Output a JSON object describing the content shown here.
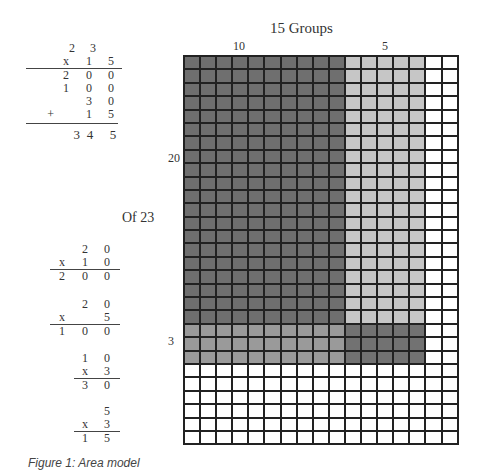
{
  "title": "15 Groups",
  "column_labels": {
    "tens": "10",
    "ones": "5"
  },
  "row_labels": {
    "tens": "20",
    "ones": "3"
  },
  "side_label": "Of 23",
  "main_problem": {
    "rows": [
      [
        "",
        "",
        "2",
        "3"
      ],
      [
        "",
        "x",
        "1",
        "5"
      ],
      [
        "",
        "2",
        "0",
        "0"
      ],
      [
        "",
        "1",
        "0",
        "0"
      ],
      [
        "",
        "",
        "3",
        "0"
      ],
      [
        "+",
        "",
        "1",
        "5"
      ],
      [
        "",
        "3",
        "4",
        "5"
      ]
    ]
  },
  "partial_products": [
    {
      "rows": [
        [
          "",
          "2",
          "0"
        ],
        [
          "x",
          "1",
          "0"
        ],
        [
          "2",
          "0",
          "0"
        ]
      ]
    },
    {
      "rows": [
        [
          "",
          "2",
          "0"
        ],
        [
          "x",
          "",
          "5"
        ],
        [
          "1",
          "0",
          "0"
        ]
      ]
    },
    {
      "rows": [
        [
          "1",
          "0"
        ],
        [
          "x",
          "3"
        ],
        [
          "3",
          "0"
        ]
      ]
    },
    {
      "rows": [
        [
          "",
          "5"
        ],
        [
          "x",
          "3"
        ],
        [
          "1",
          "5"
        ]
      ]
    }
  ],
  "grid": {
    "columns": 17,
    "rows": 29,
    "tens_columns": 10,
    "ones_columns": 5,
    "tens_rows": 20,
    "ones_rows": 3,
    "colors": {
      "tens_by_tens": "#6f6f6f",
      "ones_by_tens": "#c6c6c6",
      "tens_by_ones": "#9a9a9a",
      "ones_by_ones": "#727272",
      "empty": "#ffffff",
      "line": "#222222"
    }
  },
  "caption": "Figure 1: Area model"
}
